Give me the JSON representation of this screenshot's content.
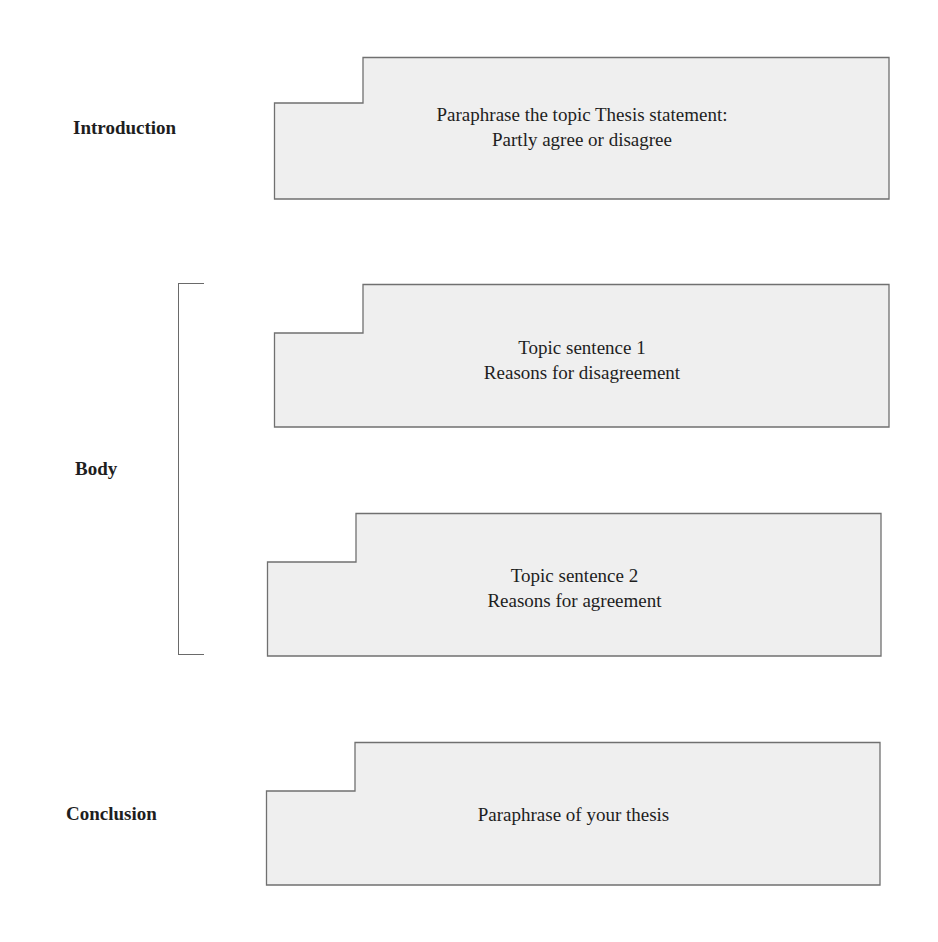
{
  "sections": {
    "introduction": "Introduction",
    "body": "Body",
    "conclusion": "Conclusion"
  },
  "boxes": [
    {
      "lines": [
        "Paraphrase the topic Thesis statement:",
        "Partly agree or disagree"
      ]
    },
    {
      "lines": [
        "Topic sentence 1",
        "Reasons for disagreement"
      ]
    },
    {
      "lines": [
        "Topic sentence 2",
        "Reasons for agreement"
      ]
    },
    {
      "lines": [
        "Paraphrase of your thesis"
      ]
    }
  ],
  "colors": {
    "box_fill": "#efefef",
    "box_stroke": "#707070"
  }
}
